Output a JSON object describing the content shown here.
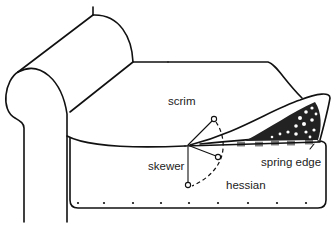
{
  "diagram": {
    "labels": {
      "scrim": "scrim",
      "skewer": "skewer",
      "spring_edge": "spring edge",
      "hessian": "hessian"
    },
    "colors": {
      "line": "#111111",
      "background": "#ffffff"
    },
    "tack_count": 14
  }
}
